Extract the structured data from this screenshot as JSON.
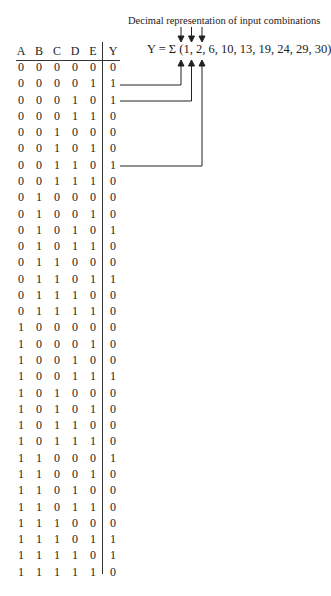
{
  "caption": "Decimal representation of input combinations",
  "formula": "Y = Σ (1, 2, 6, 10, 13, 19, 24, 29, 30)",
  "headers": [
    "A",
    "B",
    "C",
    "D",
    "E",
    "Y"
  ],
  "rows": [
    [
      "0",
      "0",
      "0",
      "0",
      "0",
      "0"
    ],
    [
      "0",
      "0",
      "0",
      "0",
      "1",
      "1"
    ],
    [
      "0",
      "0",
      "0",
      "1",
      "0",
      "1"
    ],
    [
      "0",
      "0",
      "0",
      "1",
      "1",
      "0"
    ],
    [
      "0",
      "0",
      "1",
      "0",
      "0",
      "0"
    ],
    [
      "0",
      "0",
      "1",
      "0",
      "1",
      "0"
    ],
    [
      "0",
      "0",
      "1",
      "1",
      "0",
      "1"
    ],
    [
      "0",
      "0",
      "1",
      "1",
      "1",
      "0"
    ],
    [
      "0",
      "1",
      "0",
      "0",
      "0",
      "0"
    ],
    [
      "0",
      "1",
      "0",
      "0",
      "1",
      "0"
    ],
    [
      "0",
      "1",
      "0",
      "1",
      "0",
      "1"
    ],
    [
      "0",
      "1",
      "0",
      "1",
      "1",
      "0"
    ],
    [
      "0",
      "1",
      "1",
      "0",
      "0",
      "0"
    ],
    [
      "0",
      "1",
      "1",
      "0",
      "1",
      "1"
    ],
    [
      "0",
      "1",
      "1",
      "1",
      "0",
      "0"
    ],
    [
      "0",
      "1",
      "1",
      "1",
      "1",
      "0"
    ],
    [
      "1",
      "0",
      "0",
      "0",
      "0",
      "0"
    ],
    [
      "1",
      "0",
      "0",
      "0",
      "1",
      "0"
    ],
    [
      "1",
      "0",
      "0",
      "1",
      "0",
      "0"
    ],
    [
      "1",
      "0",
      "0",
      "1",
      "1",
      "1"
    ],
    [
      "1",
      "0",
      "1",
      "0",
      "0",
      "0"
    ],
    [
      "1",
      "0",
      "1",
      "0",
      "1",
      "0"
    ],
    [
      "1",
      "0",
      "1",
      "1",
      "0",
      "0"
    ],
    [
      "1",
      "0",
      "1",
      "1",
      "1",
      "0"
    ],
    [
      "1",
      "1",
      "0",
      "0",
      "0",
      "1"
    ],
    [
      "1",
      "1",
      "0",
      "0",
      "1",
      "0"
    ],
    [
      "1",
      "1",
      "0",
      "1",
      "0",
      "0"
    ],
    [
      "1",
      "1",
      "0",
      "1",
      "1",
      "0"
    ],
    [
      "1",
      "1",
      "1",
      "0",
      "0",
      "0"
    ],
    [
      "1",
      "1",
      "1",
      "0",
      "1",
      "1"
    ],
    [
      "1",
      "1",
      "1",
      "1",
      "0",
      "1"
    ],
    [
      "1",
      "1",
      "1",
      "1",
      "1",
      "0"
    ]
  ],
  "annotated_minterms": [
    {
      "row_index": 1,
      "value": "1"
    },
    {
      "row_index": 2,
      "value": "2"
    },
    {
      "row_index": 6,
      "value": "6"
    }
  ],
  "minterms": [
    1,
    2,
    6,
    10,
    13,
    19,
    24,
    29,
    30
  ]
}
